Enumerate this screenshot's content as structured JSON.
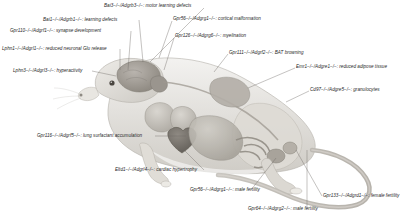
{
  "figure": {
    "background_color": "#ffffff",
    "text_color": "#262626",
    "leader_line_color": "#6b6b6b"
  },
  "annotations": [
    {
      "id": "bai3-motor-learning",
      "gene": "Bai3",
      "alias": "Adgrb3",
      "phenotype": "motor learning defects",
      "text": "Bai3−/−/Adgrb3−/−: motor learning defects",
      "organ": "brain-cerebellum",
      "align": "left",
      "x": 104,
      "y": 4
    },
    {
      "id": "bai1-learning",
      "gene": "Bai1",
      "alias": "Adgrb1",
      "phenotype": "learning defects",
      "text": "Bai1−/−/Adgrb1−/−: learning defects",
      "organ": "brain-hippocampus",
      "align": "left",
      "x": 43,
      "y": 18
    },
    {
      "id": "gpr110-synapse",
      "gene": "Gpr110",
      "alias": "Adgrf1",
      "phenotype": "synapse development",
      "text": "Gpr110−/−/Adgrf1−/−: synapse development",
      "organ": "brain-cortex",
      "align": "left",
      "x": 10,
      "y": 29
    },
    {
      "id": "lphn1-glu-release",
      "gene": "Lphn1",
      "alias": "Adgrl1",
      "phenotype": "reduced neuronal Glu release",
      "text": "Lphn1−/−/Adgrl1−/−: reduced neuronal Glu release",
      "organ": "brain-neurons",
      "align": "left",
      "x": 2,
      "y": 47
    },
    {
      "id": "lphn3-hyperactivity",
      "gene": "Lphn3",
      "alias": "Adgrl3",
      "phenotype": "hyperactivity",
      "text": "Lphn3−/−/Adgrl3−/−: hyperactivity",
      "organ": "brain",
      "align": "left",
      "x": 13,
      "y": 69
    },
    {
      "id": "gpr56-cortical-malformation",
      "gene": "Gpr56",
      "alias": "Adgrg1",
      "phenotype": "cortical malformation",
      "text": "Gpr56−/−/Adgrg1−/−: cortical malformation",
      "organ": "brain-cortex",
      "align": "left",
      "x": 173,
      "y": 17
    },
    {
      "id": "gpr126-myelination",
      "gene": "Gpr126",
      "alias": "Adgrg6",
      "phenotype": "myelination",
      "text": "Gpr126−/−/Adgrg6−/−: myelination",
      "organ": "peripheral-nerve",
      "align": "left",
      "x": 175,
      "y": 34
    },
    {
      "id": "gpr111-bat-browning",
      "gene": "Gpr111",
      "alias": "Adgrf2",
      "phenotype": "BAT browning",
      "text": "Gpr111−/−/Adgrf2−/−: BAT browning",
      "organ": "brown-adipose-tissue",
      "align": "left",
      "x": 229,
      "y": 51
    },
    {
      "id": "emr1-adipose",
      "gene": "Emr1",
      "alias": "Adgre1",
      "phenotype": "reduced adipose tissue",
      "text": "Emr1−/−/Adgre1−/−: reduced adipose tissue",
      "organ": "adipose-tissue",
      "align": "left",
      "x": 296,
      "y": 65
    },
    {
      "id": "cd97-granulocytes",
      "gene": "Cd97",
      "alias": "Adgre5",
      "phenotype": "granulocytes",
      "text": "Cd97−/−/Adgre5−/−: granulocytes",
      "organ": "bone-marrow-granulocytes",
      "align": "left",
      "x": 310,
      "y": 88
    },
    {
      "id": "gpr116-lung-surfactant",
      "gene": "Gpr116",
      "alias": "Adgrf5",
      "phenotype": "lung surfactant accumulation",
      "text": "Gpr116−/−/Adgrf5−/−: lung surfactant accumulation",
      "organ": "lung",
      "align": "left",
      "x": 37,
      "y": 134
    },
    {
      "id": "eltd1-cardiac-hypertrophy",
      "gene": "Eltd1",
      "alias": "Adgrl4",
      "phenotype": "cardiac hypertrophy",
      "text": "Eltd1−/−/Adgrl4−/−: cardiac hypertrophy",
      "organ": "heart",
      "align": "left",
      "x": 115,
      "y": 168
    },
    {
      "id": "gpr56-male-fertility",
      "gene": "Gpr56",
      "alias": "Adgrg1",
      "phenotype": "male fertility",
      "text": "Gpr56−/−/Adgrg1−/−: male fertility",
      "organ": "testis",
      "align": "left",
      "x": 190,
      "y": 188
    },
    {
      "id": "gpr64-male-fertility",
      "gene": "Gpr64",
      "alias": "Adgrg2",
      "phenotype": "male fertility",
      "text": "Gpr64−/−/Adgrg2−/−: male fertility",
      "organ": "epididymis",
      "align": "left",
      "x": 248,
      "y": 207
    },
    {
      "id": "gpr133-female-fertility",
      "gene": "Gpr133",
      "alias": "Adgrd1",
      "phenotype": "female fertility",
      "text": "Gpr133−/−/Adgrd1−/−: female fertility",
      "organ": "ovary-uterus",
      "align": "left",
      "x": 323,
      "y": 194
    }
  ]
}
